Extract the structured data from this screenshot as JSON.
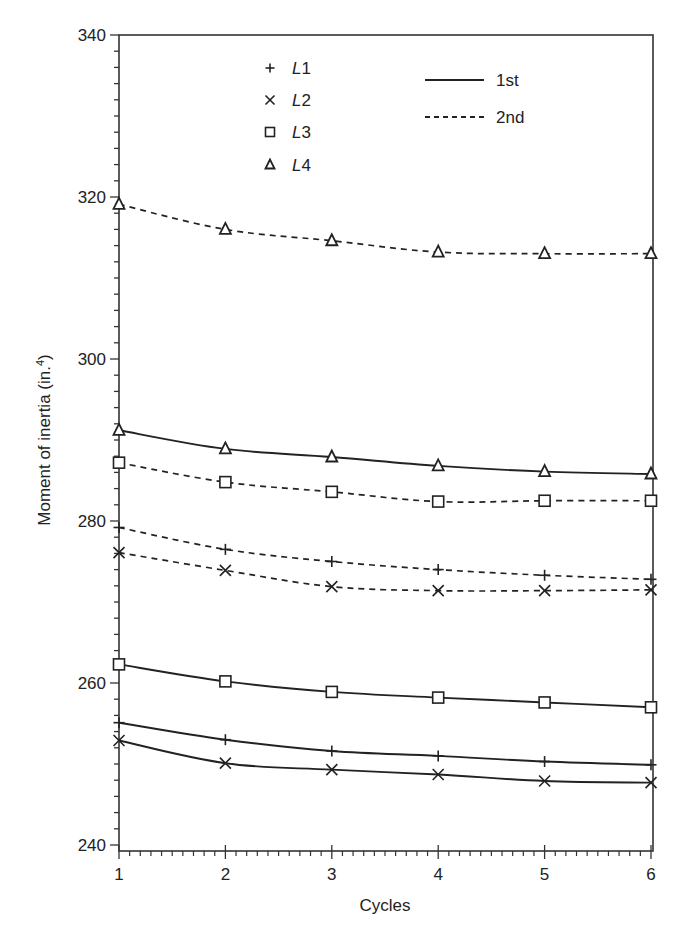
{
  "chart_data": {
    "type": "line",
    "title": "",
    "xlabel": "Cycles",
    "ylabel": "Moment of inertia (in.",
    "ylabel_superscript": "4",
    "ylabel_suffix": ")",
    "xlim": [
      1,
      6
    ],
    "ylim": [
      240,
      340
    ],
    "x_ticks": [
      1,
      2,
      3,
      4,
      5,
      6
    ],
    "y_ticks": [
      240,
      260,
      280,
      300,
      320,
      340
    ],
    "x_minor_step": 0.1,
    "y_minor_step": 2,
    "grid": false,
    "x": [
      1,
      2,
      3,
      4,
      5,
      6
    ],
    "series": [
      {
        "name": "L1 1st",
        "specimen": "L1",
        "cycle_type": "1st",
        "marker": "plus",
        "line": "solid",
        "values": [
          255.1,
          253.0,
          251.6,
          251.0,
          250.3,
          249.9
        ]
      },
      {
        "name": "L2 1st",
        "specimen": "L2",
        "cycle_type": "1st",
        "marker": "cross",
        "line": "solid",
        "values": [
          252.9,
          250.1,
          249.3,
          248.7,
          247.9,
          247.7
        ]
      },
      {
        "name": "L3 1st",
        "specimen": "L3",
        "cycle_type": "1st",
        "marker": "square",
        "line": "solid",
        "values": [
          262.3,
          260.2,
          258.9,
          258.2,
          257.6,
          257.0
        ]
      },
      {
        "name": "L4 1st",
        "specimen": "L4",
        "cycle_type": "1st",
        "marker": "triangle",
        "line": "solid",
        "values": [
          291.2,
          288.9,
          287.9,
          286.8,
          286.1,
          285.8
        ]
      },
      {
        "name": "L1 2nd",
        "specimen": "L1",
        "cycle_type": "2nd",
        "marker": "plus",
        "line": "dashed",
        "values": [
          279.2,
          276.5,
          275.0,
          274.0,
          273.3,
          272.8
        ]
      },
      {
        "name": "L2 2nd",
        "specimen": "L2",
        "cycle_type": "2nd",
        "marker": "cross",
        "line": "dashed",
        "values": [
          276.1,
          273.9,
          271.9,
          271.4,
          271.4,
          271.5
        ]
      },
      {
        "name": "L3 2nd",
        "specimen": "L3",
        "cycle_type": "2nd",
        "marker": "square",
        "line": "dashed",
        "values": [
          287.2,
          284.8,
          283.6,
          282.4,
          282.5,
          282.5
        ]
      },
      {
        "name": "L4 2nd",
        "specimen": "L4",
        "cycle_type": "2nd",
        "marker": "triangle",
        "line": "dashed",
        "values": [
          319.1,
          316.0,
          314.6,
          313.2,
          313.0,
          313.0
        ]
      }
    ],
    "legend": {
      "position": "upper-center",
      "markers": [
        {
          "marker": "plus",
          "prefix": "L",
          "suffix": "1"
        },
        {
          "marker": "cross",
          "prefix": "L",
          "suffix": "2"
        },
        {
          "marker": "square",
          "prefix": "L",
          "suffix": "3"
        },
        {
          "marker": "triangle",
          "prefix": "L",
          "suffix": "4"
        }
      ],
      "lines": [
        {
          "line": "solid",
          "label": "1st"
        },
        {
          "line": "dashed",
          "label": "2nd"
        }
      ]
    }
  },
  "style": {
    "line_color": "#222222",
    "axis_color": "#333333",
    "background": "#ffffff"
  }
}
